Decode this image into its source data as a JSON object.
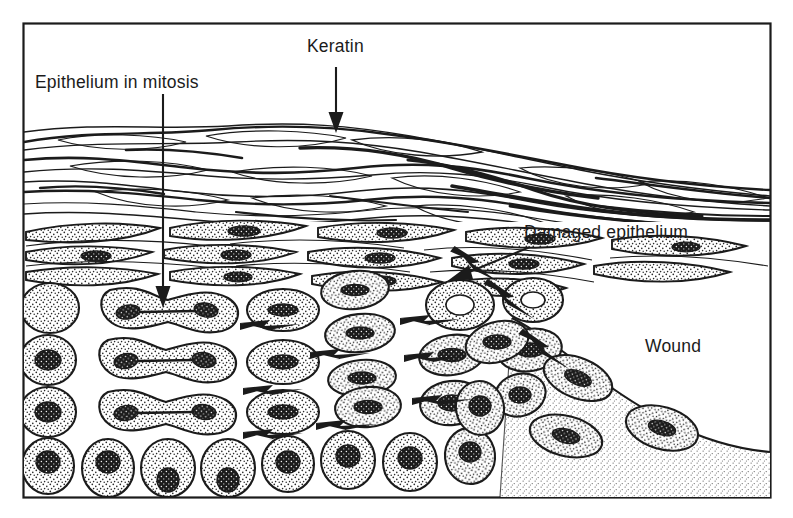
{
  "figure": {
    "type": "labelled biological cross-section diagram",
    "frame": {
      "stroke": "#1b1b1b",
      "x": 23,
      "y": 23,
      "width": 748,
      "height": 475
    }
  },
  "labels": {
    "epithelium_in_mitosis": "Epithelium in mitosis",
    "keratin": "Keratin",
    "damaged_epithelium": "Damaged epithelium",
    "wound": "Wound"
  },
  "colors": {
    "ink": "#1b1b1b",
    "paper": "#ffffff",
    "cell_fill": "#ffffff",
    "stipple": "#2a2a2a",
    "nucleus": "#1b1b1b",
    "wound_bed": "#f2f2f2"
  },
  "layers": [
    {
      "name": "keratin",
      "label": "Keratin",
      "description": "wavy overlapping flattened keratin lamellae",
      "y_from": 120,
      "y_to": 215
    },
    {
      "name": "squamous",
      "label": "Flattened squamous cells",
      "description": "spindle / lens shaped stippled cells with elongated nuclei",
      "y_from": 215,
      "y_to": 288
    },
    {
      "name": "proliferative",
      "label": "Proliferative layer",
      "description": "rounded stippled cells, several in mitosis",
      "y_from": 288,
      "y_to": 420
    },
    {
      "name": "basal",
      "label": "Basal layer",
      "description": "rounded basal cells with dark nuclei",
      "y_from": 420,
      "y_to": 498
    }
  ],
  "annotations": [
    {
      "name": "keratin-pointer",
      "target": "keratin layer surface",
      "label": "Keratin",
      "arrow": "vertical-down"
    },
    {
      "name": "epithelium-in-mitosis-pointer",
      "target": "dividing cell",
      "label": "Epithelium in mitosis",
      "arrow": "long-vertical-down"
    },
    {
      "name": "damaged-epithelium-pointer",
      "target": "torn epithelial edge",
      "label": "Damaged epithelium",
      "arrow": "diagonal-down-left"
    },
    {
      "name": "wound-region-label",
      "target": "open wound bed",
      "label": "Wound",
      "arrow": "none"
    }
  ],
  "migration_arrows": {
    "horizontal_count": 8,
    "diagonal_count": 3,
    "meaning": "direction of epithelial cell migration toward the wound"
  },
  "wound_bed": {
    "fill": "stippled light grey",
    "boundary": "curve descending from the torn epithelial edge to the lower right frame"
  }
}
